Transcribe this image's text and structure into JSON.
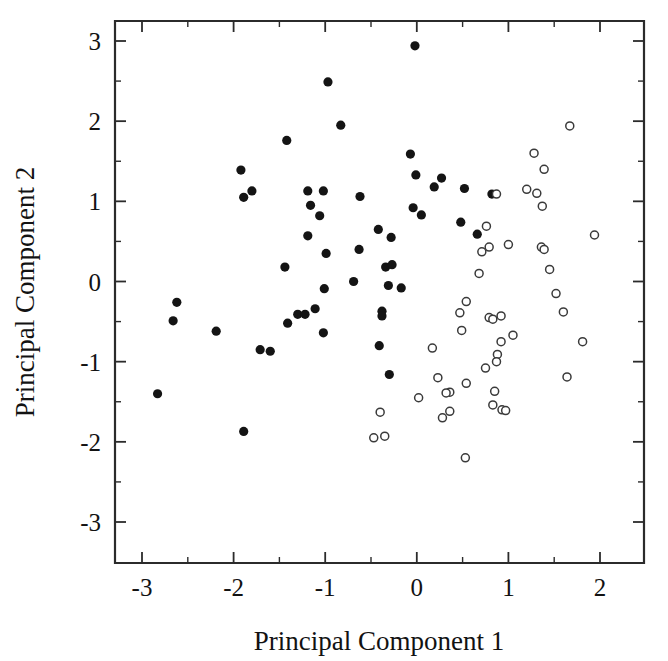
{
  "chart_data": {
    "type": "scatter",
    "title": "",
    "xlabel": "Principal Component 1",
    "ylabel": "Principal Component 2",
    "xlim": [
      -3.3,
      2.3
    ],
    "ylim": [
      -3.0,
      3.3
    ],
    "xticks": [
      -3,
      -2,
      -1,
      0,
      1,
      2
    ],
    "yticks": [
      -3,
      -2,
      -1,
      0,
      1,
      2,
      3
    ],
    "xtick_labels": [
      "-3",
      "-2",
      "-1",
      "0",
      "1",
      "2"
    ],
    "ytick_labels": [
      "-3",
      "-2",
      "-1",
      "0",
      "1",
      "2",
      "3"
    ],
    "minor_ticks": true,
    "grid": false,
    "legend": "none",
    "series": [
      {
        "name": "Group A (filled circles)",
        "marker": "filled-circle",
        "color": "#141414",
        "points": [
          [
            -0.02,
            2.94
          ],
          [
            -0.97,
            2.49
          ],
          [
            -0.83,
            1.95
          ],
          [
            -1.42,
            1.76
          ],
          [
            -0.07,
            1.59
          ],
          [
            -1.92,
            1.39
          ],
          [
            -0.01,
            1.33
          ],
          [
            0.27,
            1.29
          ],
          [
            0.19,
            1.18
          ],
          [
            0.52,
            1.16
          ],
          [
            -1.8,
            1.13
          ],
          [
            -1.19,
            1.13
          ],
          [
            -1.02,
            1.13
          ],
          [
            0.82,
            1.09
          ],
          [
            -0.62,
            1.06
          ],
          [
            -1.89,
            1.05
          ],
          [
            -1.16,
            0.95
          ],
          [
            -0.04,
            0.92
          ],
          [
            0.05,
            0.83
          ],
          [
            -1.06,
            0.82
          ],
          [
            0.48,
            0.74
          ],
          [
            -0.42,
            0.65
          ],
          [
            0.66,
            0.59
          ],
          [
            -1.19,
            0.57
          ],
          [
            -0.28,
            0.55
          ],
          [
            -0.63,
            0.4
          ],
          [
            -0.99,
            0.35
          ],
          [
            -0.34,
            0.18
          ],
          [
            -0.27,
            0.21
          ],
          [
            -1.44,
            0.18
          ],
          [
            -0.69,
            0.0
          ],
          [
            -1.01,
            -0.09
          ],
          [
            -0.31,
            -0.05
          ],
          [
            -0.17,
            -0.08
          ],
          [
            -2.62,
            -0.26
          ],
          [
            -1.11,
            -0.34
          ],
          [
            -1.3,
            -0.41
          ],
          [
            -1.22,
            -0.41
          ],
          [
            -0.38,
            -0.37
          ],
          [
            -0.38,
            -0.43
          ],
          [
            -2.66,
            -0.49
          ],
          [
            -1.41,
            -0.52
          ],
          [
            -2.19,
            -0.62
          ],
          [
            -1.02,
            -0.64
          ],
          [
            -1.71,
            -0.85
          ],
          [
            -1.6,
            -0.87
          ],
          [
            -0.41,
            -0.8
          ],
          [
            -0.3,
            -1.16
          ],
          [
            -2.83,
            -1.4
          ],
          [
            -1.89,
            -1.87
          ]
        ]
      },
      {
        "name": "Group B (open circles)",
        "marker": "open-circle",
        "color": "#3a3a3a",
        "points": [
          [
            1.67,
            1.94
          ],
          [
            1.28,
            1.6
          ],
          [
            1.39,
            1.4
          ],
          [
            0.87,
            1.09
          ],
          [
            1.2,
            1.15
          ],
          [
            1.31,
            1.1
          ],
          [
            1.37,
            0.94
          ],
          [
            0.76,
            0.69
          ],
          [
            1.94,
            0.58
          ],
          [
            0.79,
            0.43
          ],
          [
            1.0,
            0.46
          ],
          [
            1.36,
            0.43
          ],
          [
            1.39,
            0.4
          ],
          [
            0.71,
            0.37
          ],
          [
            0.68,
            0.1
          ],
          [
            1.45,
            0.15
          ],
          [
            1.52,
            -0.15
          ],
          [
            0.54,
            -0.25
          ],
          [
            0.47,
            -0.39
          ],
          [
            0.79,
            -0.45
          ],
          [
            0.83,
            -0.47
          ],
          [
            0.92,
            -0.43
          ],
          [
            1.6,
            -0.38
          ],
          [
            0.49,
            -0.61
          ],
          [
            1.05,
            -0.67
          ],
          [
            0.92,
            -0.75
          ],
          [
            1.81,
            -0.75
          ],
          [
            0.17,
            -0.83
          ],
          [
            0.88,
            -0.91
          ],
          [
            0.87,
            -1.0
          ],
          [
            0.75,
            -1.08
          ],
          [
            1.64,
            -1.19
          ],
          [
            0.23,
            -1.2
          ],
          [
            0.54,
            -1.27
          ],
          [
            0.36,
            -1.38
          ],
          [
            0.32,
            -1.39
          ],
          [
            0.85,
            -1.37
          ],
          [
            0.02,
            -1.45
          ],
          [
            0.83,
            -1.54
          ],
          [
            0.93,
            -1.6
          ],
          [
            0.97,
            -1.61
          ],
          [
            -0.4,
            -1.63
          ],
          [
            0.36,
            -1.62
          ],
          [
            0.28,
            -1.7
          ],
          [
            -0.47,
            -1.95
          ],
          [
            -0.35,
            -1.93
          ],
          [
            0.53,
            -2.2
          ]
        ]
      }
    ]
  },
  "axes": {
    "x_title": "Principal Component 1",
    "y_title": "Principal Component 2"
  }
}
